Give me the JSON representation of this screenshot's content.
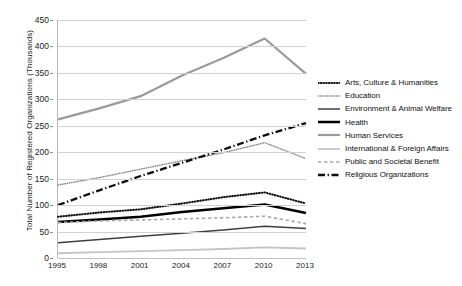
{
  "chart_data": {
    "type": "line",
    "title": "",
    "xlabel": "",
    "ylabel": "Total Number of Registered Organizations (Thousands)",
    "x": [
      1995,
      1998,
      2001,
      2004,
      2007,
      2010,
      2013
    ],
    "xtick_labels": [
      "1995",
      "1998",
      "2001",
      "2004",
      "2007",
      "2010",
      "2013"
    ],
    "ylim": [
      0,
      450
    ],
    "ytick_labels": [
      "0",
      "50",
      "100",
      "150",
      "200",
      "250",
      "300",
      "350",
      "400",
      "450"
    ],
    "ytick_values": [
      0,
      50,
      100,
      150,
      200,
      250,
      300,
      350,
      400,
      450
    ],
    "grid": true,
    "legend_position": "right",
    "series": [
      {
        "name": "Arts, Culture & Humanities",
        "values": [
          78,
          86,
          92,
          103,
          115,
          124,
          103
        ],
        "color": "#111111",
        "style": "dotted-bold",
        "width": 2.1,
        "dash": "0.6,2.1"
      },
      {
        "name": "Education",
        "values": [
          138,
          152,
          168,
          184,
          199,
          218,
          188
        ],
        "color": "#8a8a8a",
        "style": "dotted-fine",
        "width": 1.5,
        "dash": "0.5,1.8"
      },
      {
        "name": "Environment & Animal Welfare",
        "values": [
          29,
          35,
          41,
          47,
          53,
          60,
          56
        ],
        "color": "#3f3f3f",
        "style": "solid",
        "width": 1.5,
        "dash": "none"
      },
      {
        "name": "Health",
        "values": [
          68,
          73,
          78,
          87,
          94,
          101,
          85
        ],
        "color": "#000000",
        "style": "solid-bold",
        "width": 2.5,
        "dash": "none"
      },
      {
        "name": "Human Services",
        "values": [
          262,
          283,
          306,
          345,
          378,
          415,
          348
        ],
        "color": "#9a9a9a",
        "style": "solid",
        "width": 2.2,
        "dash": "none"
      },
      {
        "name": "International & Foreign Affairs",
        "values": [
          9,
          11,
          13,
          15,
          17,
          20,
          18
        ],
        "color": "#c4c4c4",
        "style": "solid",
        "width": 1.8,
        "dash": "none"
      },
      {
        "name": "Public and Societal Benefit",
        "values": [
          67,
          70,
          72,
          74,
          76,
          79,
          65
        ],
        "color": "#a8a8a8",
        "style": "dashed",
        "width": 1.6,
        "dash": "3.4,2.6"
      },
      {
        "name": "Religious Organizations",
        "values": [
          100,
          128,
          155,
          180,
          205,
          232,
          255
        ],
        "color": "#0d0d0d",
        "style": "dash-dot",
        "width": 2.3,
        "dash": "7,2.6,1.3,2.6"
      }
    ]
  }
}
